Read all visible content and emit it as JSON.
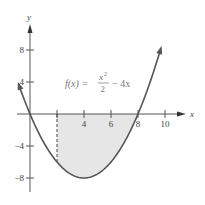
{
  "chart_data": {
    "type": "line",
    "title": "",
    "function": "f(x) = x^2/2 - 4x",
    "annotation": {
      "prefix": "f(x) =",
      "numerator": "x",
      "exponent": "2",
      "denominator": "2",
      "suffix": "− 4x"
    },
    "xlabel": "x",
    "ylabel": "y",
    "xlim": [
      -1,
      10.5
    ],
    "ylim": [
      -10,
      10
    ],
    "x_ticks": [
      4,
      6,
      8,
      10
    ],
    "x_tick_labels": [
      "4",
      "6",
      "8",
      "10"
    ],
    "x_tick_marks": [
      2,
      4,
      6,
      8,
      10
    ],
    "y_ticks": [
      8,
      4,
      -4,
      -8
    ],
    "y_tick_labels": [
      "8",
      "4",
      "−4",
      "−8"
    ],
    "series": [
      {
        "name": "f(x)",
        "x": [
          -0.85,
          0,
          1,
          2,
          3,
          4,
          5,
          6,
          7,
          8,
          9,
          9.7
        ],
        "values": [
          3.76,
          0,
          -3.5,
          -6,
          -7.5,
          -8,
          -7.5,
          -6,
          -3.5,
          0,
          4.5,
          8.25
        ]
      }
    ],
    "shaded_region": {
      "from_x": 2,
      "to_x": 8,
      "between": "curve and x-axis",
      "color": "#e6e6e6"
    },
    "dashed_line": {
      "x": 2,
      "from_y": 0,
      "to_y": -6
    },
    "grid": false,
    "colors": {
      "curve": "#555555",
      "axis": "#555555",
      "shade": "#e6e6e6",
      "text": "#444444"
    }
  }
}
